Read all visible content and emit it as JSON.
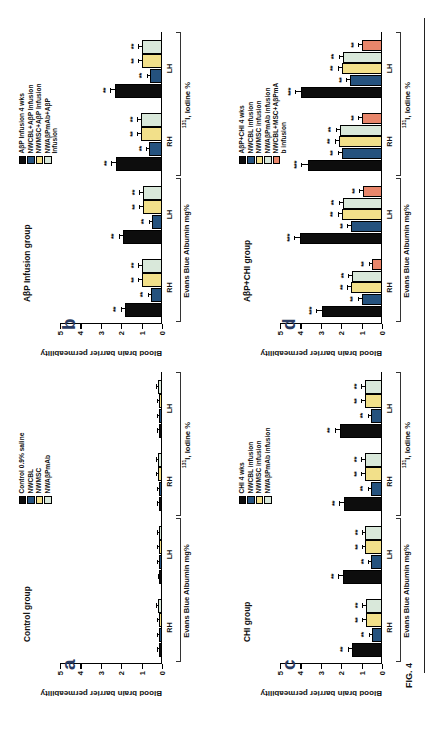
{
  "figure": {
    "caption": "FIG. 4",
    "y_axis_label": "Blood brain barrier permeability",
    "y_ticks": [
      "0",
      "1",
      "2",
      "3",
      "4",
      "5"
    ],
    "y_min": 0,
    "y_max": 5,
    "measure_labels": [
      "Evans Blue Albumin mg%",
      "I, Iodine %"
    ],
    "iodine_superscript": "131",
    "iodine_label_main": "I, Iodine %",
    "hemisphere_labels": [
      "RH",
      "LH"
    ],
    "colors": {
      "black": "#0d0d0d",
      "blue": "#25527e",
      "yellow": "#f2e08a",
      "paleGreen": "#d9e8da",
      "salmon": "#e8866b",
      "axis": "#000000",
      "panel_label": "#2b3c63"
    }
  },
  "panels": [
    {
      "id": "a",
      "label": "a",
      "title": "Control group",
      "legend": [
        {
          "label": "Control 0.9% saline",
          "color": "#0d0d0d"
        },
        {
          "label": "NWCBL",
          "color": "#25527e"
        },
        {
          "label": "NWMSC",
          "color": "#f2e08a"
        },
        {
          "label": "NWAβPmAb",
          "color": "#d9e8da"
        }
      ],
      "chart_data": {
        "type": "bar",
        "title": "Control group",
        "ylabel": "Blood brain barrier permeability",
        "ylim": [
          0,
          5
        ],
        "grid": false,
        "legend_position": "top-left",
        "categories": [
          "Evans Blue Albumin mg% – RH",
          "Evans Blue Albumin mg% – LH",
          "131I, Iodine % – RH",
          "131I, Iodine % – LH"
        ],
        "series": [
          {
            "name": "Control 0.9% saline",
            "color": "#0d0d0d",
            "values": [
              0.14,
              0.13,
              0.15,
              0.14
            ],
            "errors": [
              0.04,
              0.04,
              0.04,
              0.04
            ],
            "significance": [
              "",
              "",
              "",
              ""
            ]
          },
          {
            "name": "NWCBL",
            "color": "#25527e",
            "values": [
              0.16,
              0.15,
              0.17,
              0.16
            ],
            "errors": [
              0.04,
              0.04,
              0.04,
              0.04
            ],
            "significance": [
              "",
              "",
              "",
              ""
            ]
          },
          {
            "name": "NWMSC",
            "color": "#f2e08a",
            "values": [
              0.17,
              0.16,
              0.18,
              0.17
            ],
            "errors": [
              0.05,
              0.04,
              0.05,
              0.04
            ],
            "significance": [
              "",
              "",
              "",
              ""
            ]
          },
          {
            "name": "NWAβPmAb",
            "color": "#d9e8da",
            "values": [
              0.18,
              0.17,
              0.19,
              0.18
            ],
            "errors": [
              0.05,
              0.05,
              0.05,
              0.05
            ],
            "significance": [
              "",
              "",
              "",
              ""
            ]
          }
        ]
      }
    },
    {
      "id": "b",
      "label": "b",
      "title": "AβP Infusion group",
      "legend": [
        {
          "label": "AβP Infusion 4 wks",
          "color": "#0d0d0d"
        },
        {
          "label": "NWCBL+AβP Infusion",
          "color": "#25527e"
        },
        {
          "label": "NWMSC+AβP Infusion",
          "color": "#f2e08a"
        },
        {
          "label": "NWAβPmAb+AβP\nInfusion",
          "color": "#d9e8da"
        }
      ],
      "chart_data": {
        "type": "bar",
        "title": "AβP Infusion group",
        "ylabel": "Blood brain barrier permeability",
        "ylim": [
          0,
          5
        ],
        "grid": false,
        "legend_position": "top-left",
        "categories": [
          "Evans Blue Albumin mg% – RH",
          "Evans Blue Albumin mg% – LH",
          "131I, Iodine % – RH",
          "131I, Iodine % – LH"
        ],
        "series": [
          {
            "name": "AβP Infusion 4 wks",
            "color": "#0d0d0d",
            "values": [
              1.8,
              1.9,
              2.25,
              2.3
            ],
            "errors": [
              0.18,
              0.18,
              0.2,
              0.2
            ],
            "significance": [
              "**",
              "**",
              "**",
              "**"
            ]
          },
          {
            "name": "NWCBL+AβP Infusion",
            "color": "#25527e",
            "values": [
              0.55,
              0.5,
              0.62,
              0.6
            ],
            "errors": [
              0.1,
              0.09,
              0.1,
              0.1
            ],
            "significance": [
              "**",
              "**",
              "**",
              "**"
            ]
          },
          {
            "name": "NWMSC+AβP Infusion",
            "color": "#f2e08a",
            "values": [
              1.0,
              0.95,
              1.05,
              1.0
            ],
            "errors": [
              0.12,
              0.12,
              0.12,
              0.12
            ],
            "significance": [
              "**",
              "**",
              "**",
              "**"
            ]
          },
          {
            "name": "NWAβPmAb+AβP Infusion",
            "color": "#d9e8da",
            "values": [
              1.0,
              0.95,
              1.05,
              1.0
            ],
            "errors": [
              0.12,
              0.12,
              0.12,
              0.12
            ],
            "significance": [
              "**",
              "**",
              "**",
              "**"
            ]
          }
        ]
      }
    },
    {
      "id": "c",
      "label": "c",
      "title": "CHI group",
      "legend": [
        {
          "label": "CHI 4 wks",
          "color": "#0d0d0d"
        },
        {
          "label": "NWCBL infusion",
          "color": "#25527e"
        },
        {
          "label": "NWMSC infusion",
          "color": "#f2e08a"
        },
        {
          "label": "NWAβPmAb infusion",
          "color": "#d9e8da"
        }
      ],
      "chart_data": {
        "type": "bar",
        "title": "CHI group",
        "ylabel": "Blood brain barrier permeability",
        "ylim": [
          0,
          5
        ],
        "grid": false,
        "legend_position": "top-left",
        "categories": [
          "Evans Blue Albumin mg% – RH",
          "Evans Blue Albumin mg% – LH",
          "131I, Iodine % – RH",
          "131I, Iodine % – LH"
        ],
        "series": [
          {
            "name": "CHI 4 wks",
            "color": "#0d0d0d",
            "values": [
              1.45,
              1.9,
              1.85,
              2.05
            ],
            "errors": [
              0.18,
              0.2,
              0.2,
              0.22
            ],
            "significance": [
              "**",
              "**",
              "**",
              "**"
            ]
          },
          {
            "name": "NWCBL infusion",
            "color": "#25527e",
            "values": [
              0.5,
              0.52,
              0.55,
              0.55
            ],
            "errors": [
              0.1,
              0.1,
              0.1,
              0.1
            ],
            "significance": [
              "**",
              "**",
              "**",
              "**"
            ]
          },
          {
            "name": "NWMSC infusion",
            "color": "#f2e08a",
            "values": [
              0.8,
              0.82,
              0.85,
              0.85
            ],
            "errors": [
              0.11,
              0.11,
              0.11,
              0.11
            ],
            "significance": [
              "**",
              "**",
              "**",
              "**"
            ]
          },
          {
            "name": "NWAβPmAb infusion",
            "color": "#d9e8da",
            "values": [
              0.8,
              0.82,
              0.85,
              0.85
            ],
            "errors": [
              0.11,
              0.11,
              0.11,
              0.11
            ],
            "significance": [
              "**",
              "**",
              "**",
              "**"
            ]
          }
        ]
      }
    },
    {
      "id": "d",
      "label": "d",
      "title": "AβP+CHI group",
      "legend": [
        {
          "label": "AβP+CHI 4 wks",
          "color": "#0d0d0d"
        },
        {
          "label": "NWCBL infusion",
          "color": "#25527e"
        },
        {
          "label": "NWMSC infusion",
          "color": "#f2e08a"
        },
        {
          "label": "NWAβPmAb infusion",
          "color": "#d9e8da"
        },
        {
          "label": "NWCBL+MSC+AβPmA\nb infusion",
          "color": "#e8866b"
        }
      ],
      "chart_data": {
        "type": "bar",
        "title": "AβP+CHI group",
        "ylabel": "Blood brain barrier permeability",
        "ylim": [
          0,
          5
        ],
        "grid": false,
        "legend_position": "top-left",
        "categories": [
          "Evans Blue Albumin mg% – RH",
          "Evans Blue Albumin mg% – LH",
          "131I, Iodine % – RH",
          "131I, Iodine % – LH"
        ],
        "series": [
          {
            "name": "AβP+CHI 4 wks",
            "color": "#0d0d0d",
            "values": [
              2.95,
              4.0,
              3.65,
              3.95
            ],
            "errors": [
              0.22,
              0.25,
              0.25,
              0.25
            ],
            "significance": [
              "***",
              "***",
              "***",
              "***"
            ]
          },
          {
            "name": "NWCBL infusion",
            "color": "#25527e",
            "values": [
              1.0,
              1.5,
              1.95,
              1.55
            ],
            "errors": [
              0.15,
              0.15,
              0.18,
              0.15
            ],
            "significance": [
              "**",
              "**",
              "**",
              "**"
            ]
          },
          {
            "name": "NWMSC infusion",
            "color": "#f2e08a",
            "values": [
              1.5,
              1.95,
              2.1,
              1.95
            ],
            "errors": [
              0.15,
              0.18,
              0.18,
              0.18
            ],
            "significance": [
              "**",
              "**",
              "**",
              "**"
            ]
          },
          {
            "name": "NWAβPmAb infusion",
            "color": "#d9e8da",
            "values": [
              1.45,
              1.9,
              2.05,
              1.9
            ],
            "errors": [
              0.15,
              0.18,
              0.18,
              0.18
            ],
            "significance": [
              "**",
              "**",
              "**",
              "**"
            ]
          },
          {
            "name": "NWCBL+MSC+AβPmAb infusion",
            "color": "#e8866b",
            "values": [
              0.5,
              0.95,
              1.0,
              1.0
            ],
            "errors": [
              0.1,
              0.12,
              0.12,
              0.12
            ],
            "significance": [
              "**",
              "**",
              "**",
              "**"
            ]
          }
        ]
      }
    }
  ]
}
